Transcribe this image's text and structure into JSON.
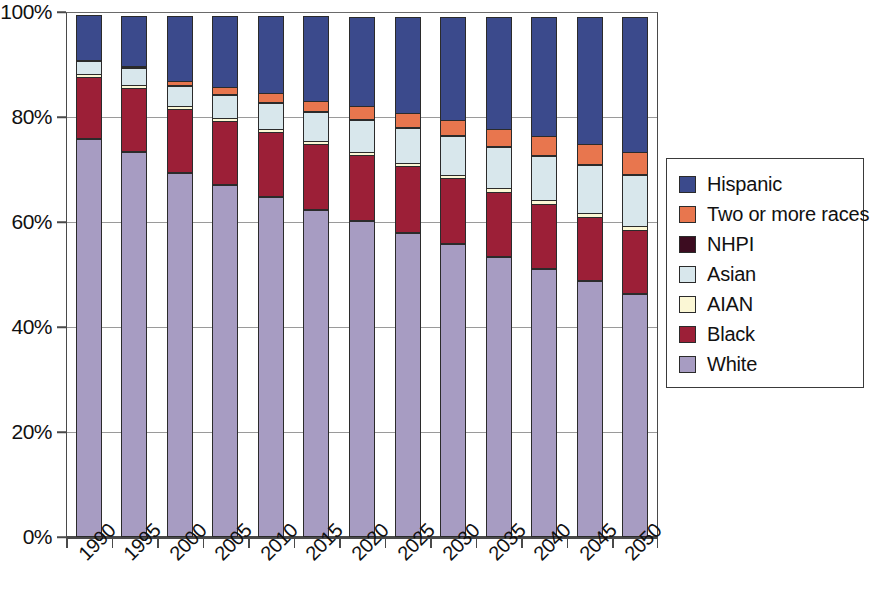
{
  "chart_data": {
    "type": "bar",
    "stacked": true,
    "stack_normalized_percent": true,
    "title": "",
    "subtitle": "",
    "xlabel": "",
    "ylabel": "",
    "grid": true,
    "legend_position": "right",
    "ylim": [
      0,
      100
    ],
    "y_ticks": [
      0,
      20,
      40,
      60,
      80,
      100
    ],
    "y_tick_labels": [
      "0%",
      "20%",
      "40%",
      "60%",
      "80%",
      "100%"
    ],
    "categories": [
      "1990",
      "1995",
      "2000",
      "2005",
      "2010",
      "2015",
      "2020",
      "2025",
      "2030",
      "2035",
      "2040",
      "2045",
      "2050"
    ],
    "series": [
      {
        "name": "White",
        "color": "#a79cc2",
        "values": [
          75.8,
          73.3,
          69.3,
          67.0,
          64.7,
          62.3,
          60.2,
          58.0,
          55.8,
          53.3,
          51.0,
          48.7,
          46.3
        ]
      },
      {
        "name": "Black",
        "color": "#9c1f37",
        "values": [
          11.8,
          12.2,
          12.2,
          12.3,
          12.4,
          12.5,
          12.6,
          12.6,
          12.6,
          12.5,
          12.4,
          12.3,
          12.2
        ]
      },
      {
        "name": "AIAN",
        "color": "#fbf7d5",
        "values": [
          0.7,
          0.8,
          0.8,
          0.8,
          0.8,
          0.8,
          0.8,
          0.8,
          0.8,
          0.8,
          0.9,
          0.9,
          0.9
        ]
      },
      {
        "name": "Asian",
        "color": "#d8e7ec",
        "values": [
          2.8,
          3.4,
          3.9,
          4.5,
          5.1,
          5.7,
          6.3,
          6.9,
          7.5,
          8.1,
          8.7,
          9.3,
          9.9
        ]
      },
      {
        "name": "NHPI",
        "color": "#3c0c20",
        "values": [
          0.2,
          0.2,
          0.2,
          0.2,
          0.2,
          0.2,
          0.3,
          0.3,
          0.3,
          0.3,
          0.3,
          0.3,
          0.3
        ]
      },
      {
        "name": "Two or more races",
        "color": "#e8764e",
        "values": [
          0.0,
          0.3,
          1.1,
          1.5,
          1.9,
          2.2,
          2.5,
          2.8,
          3.1,
          3.4,
          3.7,
          4.0,
          4.4
        ]
      },
      {
        "name": "Hispanic",
        "color": "#3b4a8c",
        "values": [
          8.7,
          9.8,
          12.5,
          13.7,
          14.9,
          16.3,
          17.3,
          18.6,
          19.9,
          21.6,
          23.0,
          24.5,
          26.0
        ]
      }
    ]
  },
  "legend": {
    "title": "",
    "items": [
      {
        "label": "Hispanic",
        "color": "#3b4a8c"
      },
      {
        "label": "Two or more races",
        "color": "#e8764e"
      },
      {
        "label": "NHPI",
        "color": "#3c0c20"
      },
      {
        "label": "Asian",
        "color": "#d8e7ec"
      },
      {
        "label": "AIAN",
        "color": "#fbf7d5"
      },
      {
        "label": "Black",
        "color": "#9c1f37"
      },
      {
        "label": "White",
        "color": "#a79cc2"
      }
    ]
  }
}
